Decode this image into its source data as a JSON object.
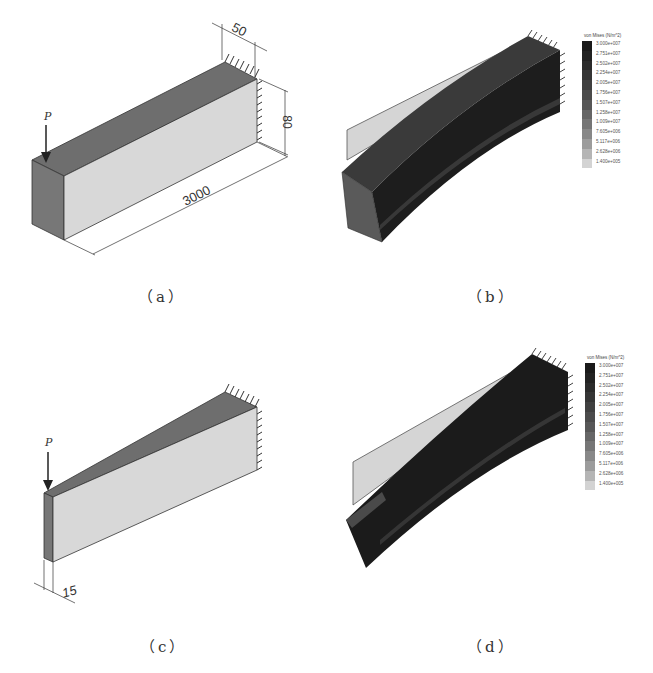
{
  "figure": {
    "panels": [
      {
        "id": "a",
        "caption": "（a）",
        "description": "Rectangular cantilever beam with point load",
        "load_label": "P",
        "dimensions": {
          "width": "50",
          "height": "80",
          "length": "3000"
        }
      },
      {
        "id": "b",
        "caption": "（b）",
        "description": "von Mises stress of rectangular beam (deformed)",
        "legend": {
          "title": "von Mises (N/m^2)",
          "values": [
            "3.000e+007",
            "2.751e+007",
            "2.502e+007",
            "2.254e+007",
            "2.005e+007",
            "1.756e+007",
            "1.507e+007",
            "1.258e+007",
            "1.009e+007",
            "7.605e+006",
            "5.117e+006",
            "2.628e+006",
            "1.400e+005"
          ],
          "colors": [
            "#1a1a1a",
            "#222222",
            "#2b2b2b",
            "#353535",
            "#404040",
            "#4b4b4b",
            "#575757",
            "#666666",
            "#767676",
            "#888888",
            "#9c9c9c",
            "#b5b5b5",
            "#d3d3d3"
          ]
        }
      },
      {
        "id": "c",
        "caption": "（c）",
        "description": "Tapered cantilever beam with point load",
        "load_label": "P",
        "dimensions": {
          "tip_width": "15"
        }
      },
      {
        "id": "d",
        "caption": "（d）",
        "description": "von Mises stress of tapered beam (deformed)",
        "legend": {
          "title": "von Mises (N/m^2)",
          "values": [
            "3.000e+007",
            "2.751e+007",
            "2.502e+007",
            "2.254e+007",
            "2.005e+007",
            "1.756e+007",
            "1.507e+007",
            "1.258e+007",
            "1.009e+007",
            "7.605e+006",
            "5.117e+006",
            "2.628e+006",
            "1.400e+005"
          ],
          "colors": [
            "#1a1a1a",
            "#222222",
            "#2b2b2b",
            "#353535",
            "#404040",
            "#4b4b4b",
            "#575757",
            "#666666",
            "#767676",
            "#888888",
            "#9c9c9c",
            "#b5b5b5",
            "#d3d3d3"
          ]
        }
      }
    ]
  }
}
